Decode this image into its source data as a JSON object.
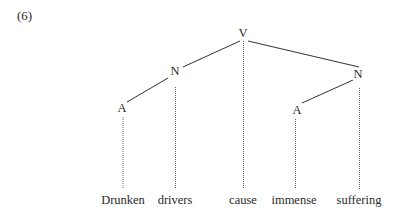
{
  "example_number": "(6)",
  "tree": {
    "nodes": [
      {
        "id": "V",
        "label": "V",
        "x": 243,
        "y": 33
      },
      {
        "id": "N1",
        "label": "N",
        "x": 175,
        "y": 71
      },
      {
        "id": "N2",
        "label": "N",
        "x": 358,
        "y": 74
      },
      {
        "id": "A1",
        "label": "A",
        "x": 122,
        "y": 108
      },
      {
        "id": "A2",
        "label": "A",
        "x": 297,
        "y": 110
      }
    ],
    "edges": [
      [
        "V",
        "N1"
      ],
      [
        "V",
        "N2"
      ],
      [
        "N1",
        "A1"
      ],
      [
        "N2",
        "A2"
      ]
    ],
    "words": [
      {
        "text": "Drunken",
        "attached_to": "A1",
        "x": 123
      },
      {
        "text": "drivers",
        "attached_to": "N1",
        "x": 175
      },
      {
        "text": "cause",
        "attached_to": "V",
        "x": 243
      },
      {
        "text": "immense",
        "attached_to": "A2",
        "x": 294
      },
      {
        "text": "suffering",
        "attached_to": "N2",
        "x": 359
      }
    ]
  }
}
